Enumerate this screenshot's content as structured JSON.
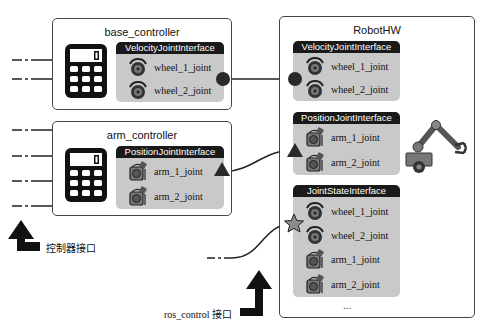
{
  "diagram": {
    "controllers": [
      {
        "name": "base_controller",
        "interface": "VelocityJointInterface",
        "joints": [
          {
            "label": "wheel_1_joint",
            "icon": "wheel-icon"
          },
          {
            "label": "wheel_2_joint",
            "icon": "wheel-icon"
          }
        ],
        "connector": "circle"
      },
      {
        "name": "arm_controller",
        "interface": "PositionJointInterface",
        "joints": [
          {
            "label": "arm_1_joint",
            "icon": "arm-joint-icon"
          },
          {
            "label": "arm_2_joint",
            "icon": "arm-joint-icon"
          }
        ],
        "connector": "triangle"
      }
    ],
    "robot_hw": {
      "name": "RobotHW",
      "interfaces": [
        {
          "name": "VelocityJointInterface",
          "connector": "circle",
          "joints": [
            {
              "label": "wheel_1_joint",
              "icon": "wheel-icon"
            },
            {
              "label": "wheel_2_joint",
              "icon": "wheel-icon"
            }
          ]
        },
        {
          "name": "PositionJointInterface",
          "connector": "triangle",
          "joints": [
            {
              "label": "arm_1_joint",
              "icon": "arm-joint-icon"
            },
            {
              "label": "arm_2_joint",
              "icon": "arm-joint-icon"
            }
          ]
        },
        {
          "name": "JointStateInterface",
          "connector": "star",
          "joints": [
            {
              "label": "wheel_1_joint",
              "icon": "wheel-icon"
            },
            {
              "label": "wheel_2_joint",
              "icon": "wheel-icon"
            },
            {
              "label": "arm_1_joint",
              "icon": "arm-joint-icon"
            },
            {
              "label": "arm_2_joint",
              "icon": "arm-joint-icon"
            }
          ]
        }
      ],
      "ellipsis": "...",
      "robot_icon": "robot-arm-icon"
    },
    "legend": {
      "controller_interface": "控制器接口",
      "ros_control_interface": "ros_control 接口"
    },
    "colors": {
      "interface_bg": "#c9c9c9",
      "interface_header": "#1a1a1a",
      "border": "#444444",
      "connector": "#2a2a2a",
      "star": "#8a8a8a"
    }
  }
}
